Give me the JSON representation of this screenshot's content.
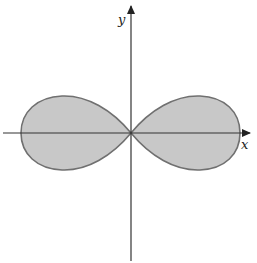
{
  "diagram": {
    "type": "lemniscate",
    "axes": {
      "x_label": "x",
      "y_label": "y"
    },
    "colors": {
      "fill": "#c8c8c8",
      "stroke": "#707070",
      "axis": "#333333"
    }
  }
}
